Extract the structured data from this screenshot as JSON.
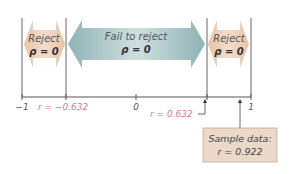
{
  "regions": {
    "left": {
      "line1": "Reject",
      "line2": "ρ = 0"
    },
    "middle": {
      "line1": "Fail to reject",
      "line2": "ρ = 0"
    },
    "right": {
      "line1": "Reject",
      "line2": "ρ = 0"
    }
  },
  "axis": {
    "ticks": [
      {
        "label": "−1",
        "value": -1
      },
      {
        "label": "0",
        "value": 0
      },
      {
        "label": "1",
        "value": 1
      }
    ],
    "critical_values": {
      "negative": "r = −0.632",
      "positive": "r = 0.632"
    }
  },
  "sample": {
    "line1": "Sample data:",
    "line2": "r = 0.922"
  },
  "colors": {
    "reject_fill": "#ecd2bd",
    "fail_fill": "#a9c4c6",
    "critical_text": "#d77b8c",
    "sample_box": "#ead8c9",
    "sample_border": "#c9a890",
    "line": "#555555"
  }
}
